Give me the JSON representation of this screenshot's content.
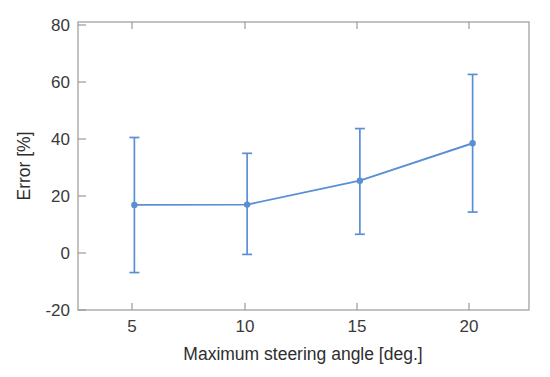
{
  "chart_data": {
    "type": "line",
    "title": "",
    "xlabel": "Maximum steering angle [deg.]",
    "ylabel": "Error [%]",
    "x": [
      5,
      10,
      15,
      20
    ],
    "xticklabels": [
      "5",
      "10",
      "15",
      "20"
    ],
    "yticklabels": [
      "80",
      "60",
      "40",
      "20",
      "0",
      "-20"
    ],
    "yticks": [
      80,
      60,
      40,
      20,
      0,
      -20
    ],
    "xlim": [
      2.5,
      22.5
    ],
    "ylim": [
      -20,
      80
    ],
    "grid": false,
    "legend": null,
    "series": [
      {
        "name": "Error",
        "values": [
          16.5,
          16.6,
          24.9,
          37.9
        ],
        "error_upper": [
          39.9,
          34.4,
          43.0,
          61.8
        ],
        "error_lower": [
          -7.0,
          -0.7,
          6.3,
          14.0
        ],
        "color": "#5b8fd4",
        "marker": "circle",
        "has_error_bars": true
      }
    ]
  },
  "axes": {
    "y_tick_0": "80",
    "y_tick_1": "60",
    "y_tick_2": "40",
    "y_tick_3": "20",
    "y_tick_4": "0",
    "y_tick_5": "-20",
    "x_tick_0": "5",
    "x_tick_1": "10",
    "x_tick_2": "15",
    "x_tick_3": "20",
    "x_axis_title": "Maximum steering angle [deg.]",
    "y_axis_title": "Error [%]"
  },
  "colors": {
    "series": "#5b8fd4",
    "axis": "#9a9a9a",
    "text": "#333333",
    "background": "#ffffff"
  }
}
